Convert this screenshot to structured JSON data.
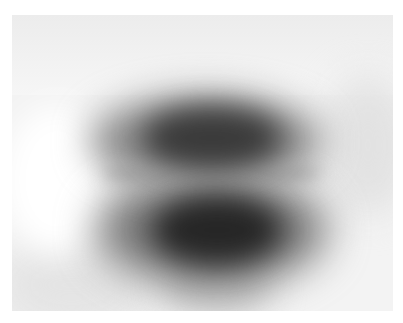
{
  "image": {
    "description": "Blurred grayscale photograph of a dark, roughly circular object split into an upper and lower lobe by a lighter horizontal band, on a light gray background with a white border",
    "colors": {
      "border": "#ffffff",
      "background": "#f3f3f3",
      "dark_core": "#262626",
      "mid_halo": "#808080"
    }
  }
}
